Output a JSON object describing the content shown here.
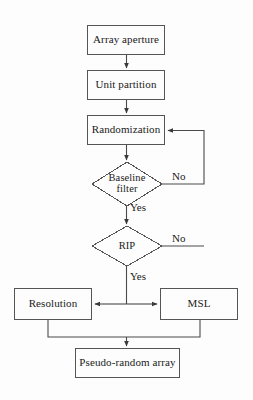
{
  "diagram": {
    "type": "flowchart",
    "background_color": "#fdfdfd",
    "stroke_color": "#4a4a4a",
    "text_color": "#1a1a1a",
    "nodes": [
      {
        "id": "array_aperture",
        "label": "Array aperture",
        "shape": "rect",
        "x": 87,
        "y": 25,
        "w": 78,
        "h": 30
      },
      {
        "id": "unit_partition",
        "label": "Unit partition",
        "shape": "rect",
        "x": 87,
        "y": 70,
        "w": 78,
        "h": 30
      },
      {
        "id": "randomization",
        "label": "Randomization",
        "shape": "rect",
        "x": 87,
        "y": 115,
        "w": 78,
        "h": 30
      },
      {
        "id": "baseline_filter",
        "label": "Baseline filter",
        "shape": "diamond",
        "x": 92,
        "y": 162,
        "w": 70,
        "h": 44
      },
      {
        "id": "rip",
        "label": "RIP",
        "shape": "diamond",
        "x": 92,
        "y": 226,
        "w": 70,
        "h": 40
      },
      {
        "id": "resolution",
        "label": "Resolution",
        "shape": "rect",
        "x": 14,
        "y": 288,
        "w": 78,
        "h": 32
      },
      {
        "id": "msl",
        "label": "MSL",
        "shape": "rect",
        "x": 160,
        "y": 288,
        "w": 78,
        "h": 32
      },
      {
        "id": "pseudo_random",
        "label": "Pseudo-random array",
        "shape": "rect",
        "x": 75,
        "y": 348,
        "w": 105,
        "h": 30
      }
    ],
    "edge_labels": [
      {
        "id": "baseline_no",
        "text": "No",
        "x": 172,
        "y": 176
      },
      {
        "id": "baseline_yes",
        "text": "Yes",
        "x": 129,
        "y": 206
      },
      {
        "id": "rip_no",
        "text": "No",
        "x": 172,
        "y": 236
      },
      {
        "id": "rip_yes",
        "text": "Yes",
        "x": 129,
        "y": 271
      }
    ],
    "edges": [
      {
        "from": "array_aperture",
        "to": "unit_partition",
        "label": ""
      },
      {
        "from": "unit_partition",
        "to": "randomization",
        "label": ""
      },
      {
        "from": "randomization",
        "to": "baseline_filter",
        "label": ""
      },
      {
        "from": "baseline_filter",
        "to": "rip",
        "label": "Yes"
      },
      {
        "from": "baseline_filter",
        "to": "randomization",
        "label": "No"
      },
      {
        "from": "rip",
        "to": "resolution",
        "label": "Yes"
      },
      {
        "from": "rip",
        "to": "msl",
        "label": "Yes"
      },
      {
        "from": "rip",
        "to": "randomization",
        "label": "No"
      },
      {
        "from": "resolution",
        "to": "pseudo_random",
        "label": ""
      },
      {
        "from": "msl",
        "to": "pseudo_random",
        "label": ""
      }
    ]
  }
}
